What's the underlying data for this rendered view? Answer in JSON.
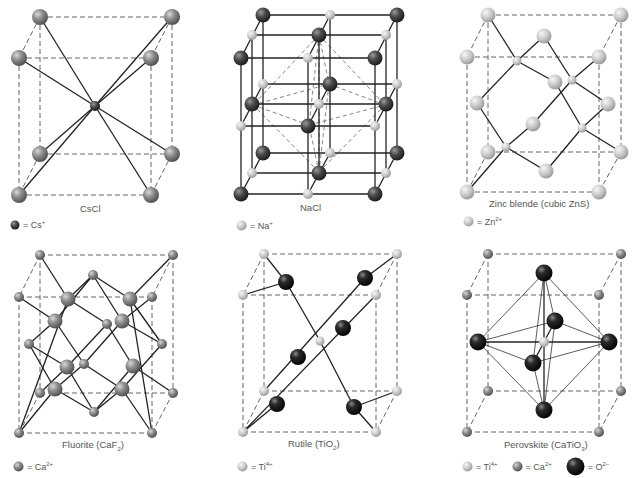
{
  "colors": {
    "background": "#ffffff",
    "atom_gray": "#8a8a8a",
    "atom_light": "#c8c8c8",
    "atom_dark": "#3a3a3a",
    "atom_black": "#1a1a1a",
    "bond": "#222222",
    "edge_dashed": "#666666",
    "text": "#555555"
  },
  "panels": [
    {
      "id": "cscl",
      "caption": "CsCl",
      "legend": [
        {
          "atom": "dark-small",
          "text": "= Cs",
          "sup": "+"
        }
      ]
    },
    {
      "id": "nacl",
      "caption": "NaCl",
      "legend": [
        {
          "atom": "light-small",
          "text": "= Na",
          "sup": "+"
        }
      ]
    },
    {
      "id": "zinc-blende",
      "caption": "Zinc blende (cubic ZnS)",
      "legend": [
        {
          "atom": "light-small",
          "text": "= Zn",
          "sup": "2+"
        }
      ]
    },
    {
      "id": "fluorite",
      "caption_main": "Fluorite (CaF",
      "caption_sub": "2",
      "caption_end": ")",
      "legend": [
        {
          "atom": "gray-small",
          "text": "= Ca",
          "sup": "2+"
        }
      ]
    },
    {
      "id": "rutile",
      "caption_main": "Rutile (TiO",
      "caption_sub": "2",
      "caption_end": ")",
      "legend": [
        {
          "atom": "light-small",
          "text": "= Ti",
          "sup": "4+"
        }
      ]
    },
    {
      "id": "perovskite",
      "caption_main": "Perovskite (CaTiO",
      "caption_sub": "3",
      "caption_end": ")",
      "legend": [
        {
          "atom": "light-small",
          "text": "= Ti",
          "sup": "4+"
        },
        {
          "atom": "gray-small",
          "text": "= Ca",
          "sup": "2+"
        },
        {
          "atom": "black-large",
          "text": "= O",
          "sup": "2−"
        }
      ]
    }
  ]
}
